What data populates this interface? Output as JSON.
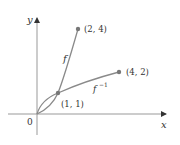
{
  "diagram": {
    "axes": {
      "x_label": "x",
      "y_label": "y",
      "origin_label": "0"
    },
    "curves": [
      {
        "name": "f",
        "label": "f",
        "from": [
          0,
          0
        ],
        "to": [
          2,
          4
        ]
      },
      {
        "name": "f-inverse",
        "label": "f",
        "label_sup": "−1",
        "from": [
          0,
          0
        ],
        "to": [
          4,
          2
        ]
      }
    ],
    "points": [
      {
        "label": "(1, 1)",
        "x": 1,
        "y": 1
      },
      {
        "label": "(2, 4)",
        "x": 2,
        "y": 4
      },
      {
        "label": "(4, 2)",
        "x": 4,
        "y": 2
      }
    ],
    "colors": {
      "curve": "#8a8a8a",
      "axis": "#999999",
      "point": "#777777",
      "text": "#333333"
    }
  }
}
